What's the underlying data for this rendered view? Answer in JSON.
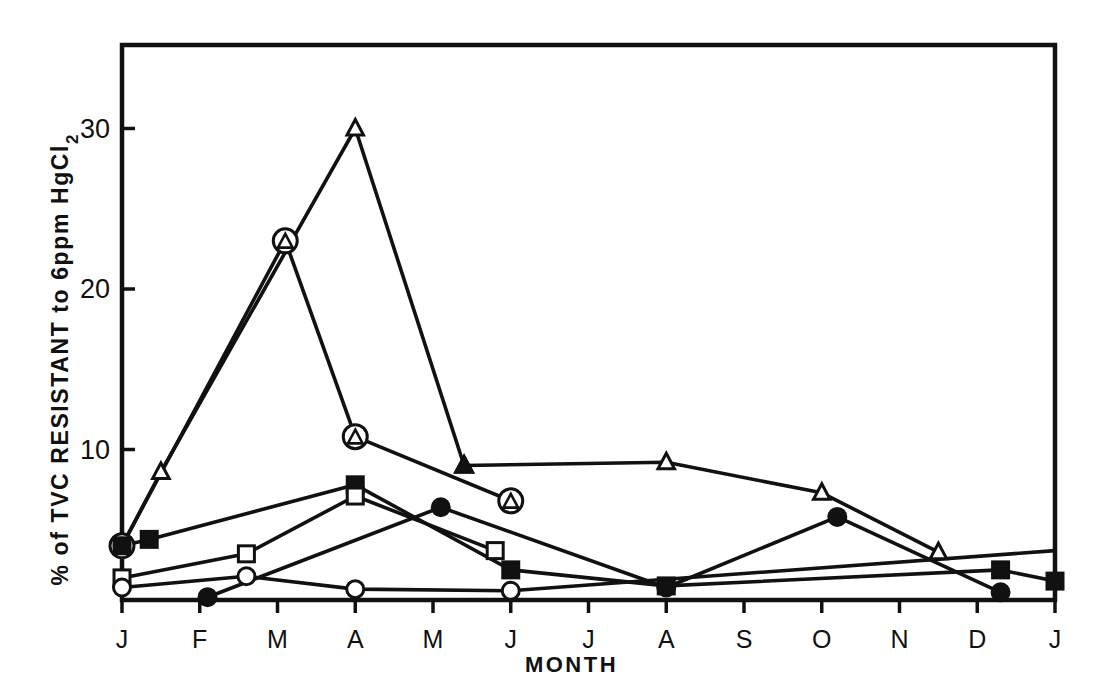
{
  "chart_data": {
    "type": "line",
    "title": "",
    "xlabel": "MONTH",
    "ylabel": "% of TVC RESISTANT to 6ppm HgCl2",
    "ylabel_main": "% of TVC RESISTANT to 6ppm HgCl",
    "ylabel_subscript": "2",
    "x_tick_labels": [
      "J",
      "F",
      "M",
      "A",
      "M",
      "J",
      "J",
      "A",
      "S",
      "O",
      "N",
      "D",
      "J"
    ],
    "y_tick_labels": [
      "10",
      "20",
      "30"
    ],
    "y_tick_values": [
      10,
      20,
      30
    ],
    "ylim": [
      0,
      35
    ],
    "xlim": [
      0,
      12
    ],
    "grid": false,
    "legend": "none",
    "line_color": "#111111",
    "marker_colors": {
      "open": "#ffffff",
      "filled": "#111111",
      "stroke": "#111111"
    },
    "series": [
      {
        "name": "open-triangle",
        "marker": "triangle-open",
        "x": [
          0,
          0.5,
          3,
          4.4,
          7,
          9,
          10.5
        ],
        "values": [
          4.0,
          8.6,
          30.0,
          9.0,
          9.2,
          7.3,
          3.6
        ]
      },
      {
        "name": "filled-triangle",
        "marker": "triangle-filled",
        "x": [
          4.4
        ],
        "values": [
          9.0
        ]
      },
      {
        "name": "circled-triangle",
        "marker": "circle-triangle",
        "x": [
          0,
          2.1,
          3,
          5
        ],
        "values": [
          4.0,
          23.0,
          10.8,
          6.8
        ]
      },
      {
        "name": "filled-square",
        "marker": "square-filled",
        "x": [
          0,
          0.35,
          3,
          5,
          7,
          11.3,
          12
        ],
        "values": [
          4.0,
          4.4,
          7.8,
          2.5,
          1.5,
          2.5,
          1.8
        ]
      },
      {
        "name": "open-square",
        "marker": "square-open",
        "x": [
          0,
          1.6,
          3,
          4.8
        ],
        "values": [
          2.0,
          3.5,
          7.1,
          3.7
        ]
      },
      {
        "name": "open-circle",
        "marker": "circle-open",
        "x": [
          0,
          1.6,
          3,
          5
        ],
        "values": [
          1.4,
          2.1,
          1.3,
          1.2
        ]
      },
      {
        "name": "filled-circle",
        "marker": "circle-filled",
        "x": [
          1.1,
          4.1,
          7,
          9.2,
          11.3
        ],
        "values": [
          0.8,
          6.4,
          1.4,
          5.8,
          1.1
        ]
      },
      {
        "name": "baseline-long",
        "marker": "none",
        "x": [
          5,
          12
        ],
        "values": [
          1.2,
          3.7
        ]
      }
    ]
  },
  "axes": {
    "x_label": "MONTH",
    "y_label_text": "% of TVC RESISTANT to 6ppm HgCl",
    "y_label_sub": "2"
  }
}
